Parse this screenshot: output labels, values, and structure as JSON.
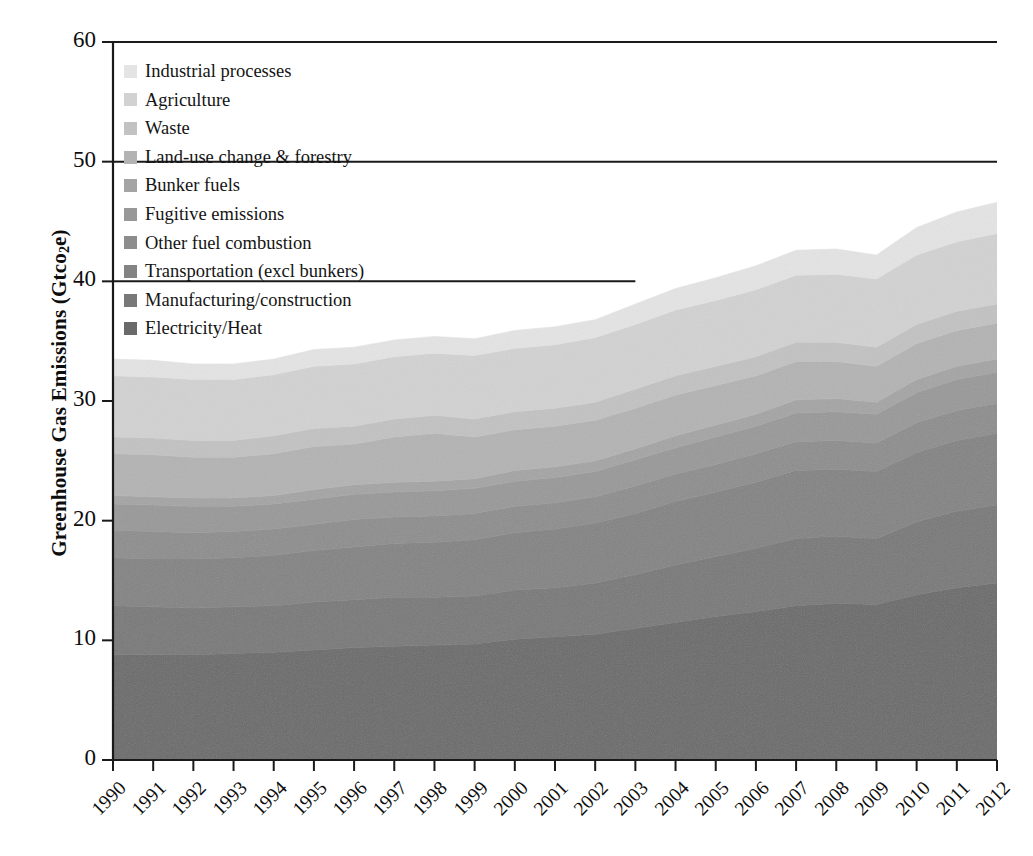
{
  "chart_data": {
    "type": "area",
    "title": "",
    "xlabel": "",
    "ylabel": "Greenhouse Gas Emissions (Gtco2e)",
    "ylabel_html": "Greenhouse Gas Emissions (Gtco<sub>2</sub>e)",
    "ylim": [
      0,
      60
    ],
    "yticks": [
      0,
      10,
      20,
      30,
      40,
      50,
      60
    ],
    "ytick_labels": [
      "0",
      "10",
      "20",
      "30",
      "40",
      "50",
      "60"
    ],
    "grid": false,
    "stacked": true,
    "legend_position": "upper-left inside plot",
    "categories": [
      "1990",
      "1991",
      "1992",
      "1993",
      "1994",
      "1995",
      "1996",
      "1997",
      "1998",
      "1999",
      "2000",
      "2001",
      "2002",
      "2003",
      "2004",
      "2005",
      "2006",
      "2007",
      "2008",
      "2009",
      "2010",
      "2011",
      "2012"
    ],
    "x": [
      1990,
      1991,
      1992,
      1993,
      1994,
      1995,
      1996,
      1997,
      1998,
      1999,
      2000,
      2001,
      2002,
      2003,
      2004,
      2005,
      2006,
      2007,
      2008,
      2009,
      2010,
      2011,
      2012
    ],
    "series": [
      {
        "name": "Electricity/Heat",
        "color": "#6a6a6a",
        "values": [
          8.8,
          8.8,
          8.8,
          8.9,
          9.0,
          9.2,
          9.4,
          9.5,
          9.6,
          9.7,
          10.1,
          10.3,
          10.5,
          11.0,
          11.5,
          12.0,
          12.4,
          12.9,
          13.1,
          13.0,
          13.8,
          14.4,
          14.8
        ]
      },
      {
        "name": "Manufacturing/construction",
        "color": "#787878",
        "values": [
          4.1,
          4.0,
          3.9,
          3.9,
          3.9,
          4.0,
          4.0,
          4.1,
          4.0,
          4.0,
          4.1,
          4.1,
          4.3,
          4.5,
          4.8,
          5.0,
          5.3,
          5.6,
          5.6,
          5.5,
          6.1,
          6.4,
          6.5
        ]
      },
      {
        "name": "Transportation (excl bunkers)",
        "color": "#838383",
        "values": [
          4.0,
          4.0,
          4.1,
          4.1,
          4.2,
          4.3,
          4.4,
          4.5,
          4.6,
          4.7,
          4.8,
          4.9,
          5.0,
          5.1,
          5.3,
          5.4,
          5.5,
          5.7,
          5.6,
          5.6,
          5.8,
          5.9,
          6.0
        ]
      },
      {
        "name": "Other fuel combustion",
        "color": "#8d8d8d",
        "values": [
          2.3,
          2.3,
          2.2,
          2.2,
          2.2,
          2.2,
          2.3,
          2.2,
          2.2,
          2.2,
          2.2,
          2.2,
          2.2,
          2.3,
          2.3,
          2.3,
          2.4,
          2.4,
          2.4,
          2.4,
          2.5,
          2.5,
          2.5
        ]
      },
      {
        "name": "Fugitive emissions",
        "color": "#989898",
        "values": [
          2.2,
          2.2,
          2.2,
          2.1,
          2.1,
          2.1,
          2.1,
          2.1,
          2.1,
          2.1,
          2.1,
          2.1,
          2.1,
          2.2,
          2.2,
          2.3,
          2.3,
          2.4,
          2.4,
          2.4,
          2.5,
          2.6,
          2.6
        ]
      },
      {
        "name": "Bunker fuels",
        "color": "#a4a4a4",
        "values": [
          0.7,
          0.7,
          0.7,
          0.7,
          0.7,
          0.8,
          0.8,
          0.8,
          0.8,
          0.8,
          0.9,
          0.9,
          0.9,
          0.9,
          1.0,
          1.0,
          1.0,
          1.1,
          1.1,
          1.0,
          1.1,
          1.1,
          1.1
        ]
      },
      {
        "name": "Land-use change & forestry",
        "color": "#b3b3b3",
        "values": [
          3.5,
          3.5,
          3.4,
          3.4,
          3.5,
          3.6,
          3.4,
          3.8,
          4.0,
          3.5,
          3.4,
          3.4,
          3.4,
          3.4,
          3.4,
          3.3,
          3.2,
          3.2,
          3.1,
          3.0,
          3.0,
          3.0,
          3.0
        ]
      },
      {
        "name": "Waste",
        "color": "#c2c2c2",
        "values": [
          1.4,
          1.4,
          1.4,
          1.4,
          1.5,
          1.5,
          1.5,
          1.5,
          1.5,
          1.5,
          1.5,
          1.5,
          1.5,
          1.6,
          1.6,
          1.6,
          1.6,
          1.6,
          1.6,
          1.6,
          1.6,
          1.6,
          1.6
        ]
      },
      {
        "name": "Agriculture",
        "color": "#d2d2d2",
        "values": [
          5.1,
          5.1,
          5.1,
          5.1,
          5.1,
          5.2,
          5.2,
          5.2,
          5.2,
          5.3,
          5.3,
          5.3,
          5.4,
          5.4,
          5.5,
          5.5,
          5.6,
          5.6,
          5.7,
          5.7,
          5.8,
          5.8,
          5.9
        ]
      },
      {
        "name": "Industrial processes",
        "color": "#e4e4e4",
        "values": [
          1.4,
          1.4,
          1.3,
          1.3,
          1.3,
          1.4,
          1.4,
          1.4,
          1.4,
          1.4,
          1.5,
          1.5,
          1.5,
          1.7,
          1.8,
          1.9,
          2.0,
          2.1,
          2.1,
          2.0,
          2.3,
          2.5,
          2.6
        ]
      }
    ],
    "totals": [
      33.5,
      33.4,
      33.1,
      33.1,
      33.5,
      34.3,
      34.5,
      35.1,
      35.4,
      35.2,
      35.9,
      36.2,
      36.8,
      38.1,
      39.4,
      40.3,
      41.3,
      42.6,
      42.7,
      42.2,
      44.5,
      45.8,
      46.6
    ]
  },
  "legend": {
    "items": [
      {
        "label": "Industrial processes",
        "color": "#e4e4e4"
      },
      {
        "label": "Agriculture",
        "color": "#d2d2d2"
      },
      {
        "label": "Waste",
        "color": "#c2c2c2"
      },
      {
        "label": "Land-use change & forestry",
        "color": "#b3b3b3"
      },
      {
        "label": "Bunker fuels",
        "color": "#a4a4a4"
      },
      {
        "label": "Fugitive emissions",
        "color": "#989898"
      },
      {
        "label": "Other fuel combustion",
        "color": "#8d8d8d"
      },
      {
        "label": "Transportation (excl bunkers)",
        "color": "#838383"
      },
      {
        "label": "Manufacturing/construction",
        "color": "#787878"
      },
      {
        "label": "Electricity/Heat",
        "color": "#6a6a6a"
      }
    ]
  },
  "axes": {
    "y_title_part1": "Greenhouse Gas Emissions (Gtco",
    "y_title_sub": "2",
    "y_title_part2": "e)"
  }
}
